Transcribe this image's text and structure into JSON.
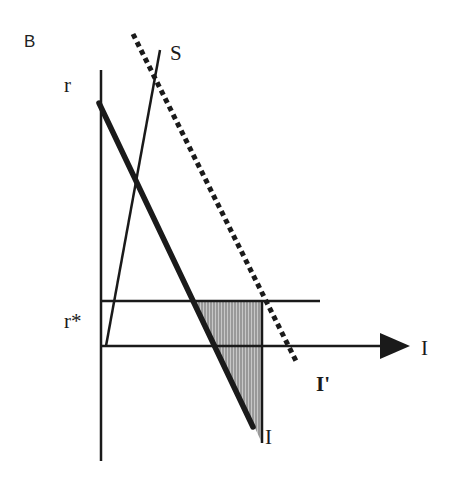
{
  "diagram": {
    "panel_label": "B",
    "labels": {
      "r_axis": "r",
      "r_star": "r*",
      "saving_curve": "S",
      "i_axis": "I",
      "investment_curve": "I",
      "investment_shifted": "I'"
    },
    "colors": {
      "line": "#1a1a1a",
      "shading": "#9a9a9a",
      "background": "#ffffff"
    },
    "elements": [
      {
        "name": "vertical-axis",
        "type": "line",
        "from": [
          101,
          70
        ],
        "to": [
          101,
          461
        ]
      },
      {
        "name": "horizontal-axis",
        "type": "arrow",
        "from": [
          101,
          346
        ],
        "to": [
          410,
          346
        ],
        "label": "I"
      },
      {
        "name": "r-star-line",
        "type": "line",
        "from": [
          101,
          301
        ],
        "to": [
          320,
          301
        ],
        "label": "r*"
      },
      {
        "name": "saving-curve",
        "type": "line",
        "from": [
          106,
          346
        ],
        "to": [
          160,
          50
        ],
        "label": "S"
      },
      {
        "name": "investment-curve",
        "type": "thick-line",
        "from": [
          99,
          103
        ],
        "to": [
          253,
          427
        ],
        "label": "I"
      },
      {
        "name": "shifted-investment-curve",
        "type": "dotted-line",
        "from": [
          133,
          34
        ],
        "to": [
          296,
          361
        ],
        "label": "I'"
      },
      {
        "name": "shaded-region",
        "type": "hatched-triangle",
        "points": [
          [
            195,
            301
          ],
          [
            262,
            301
          ],
          [
            262,
            443
          ]
        ]
      }
    ]
  }
}
